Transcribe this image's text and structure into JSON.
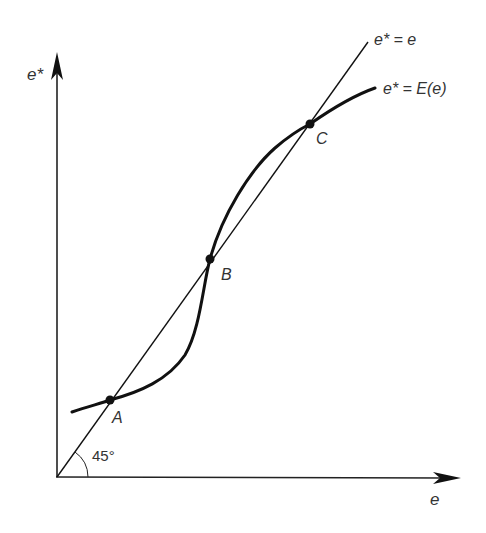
{
  "diagram": {
    "axes": {
      "y_label": "e*",
      "x_label": "e"
    },
    "lines": {
      "forty_five_label": "e* = e",
      "curve_label": "e* = E(e)"
    },
    "angle_label": "45°",
    "points": [
      {
        "name": "A",
        "label": "A"
      },
      {
        "name": "B",
        "label": "B"
      },
      {
        "name": "C",
        "label": "C"
      }
    ],
    "colors": {
      "ink": "#111111",
      "text": "#333333",
      "background": "#ffffff"
    }
  }
}
